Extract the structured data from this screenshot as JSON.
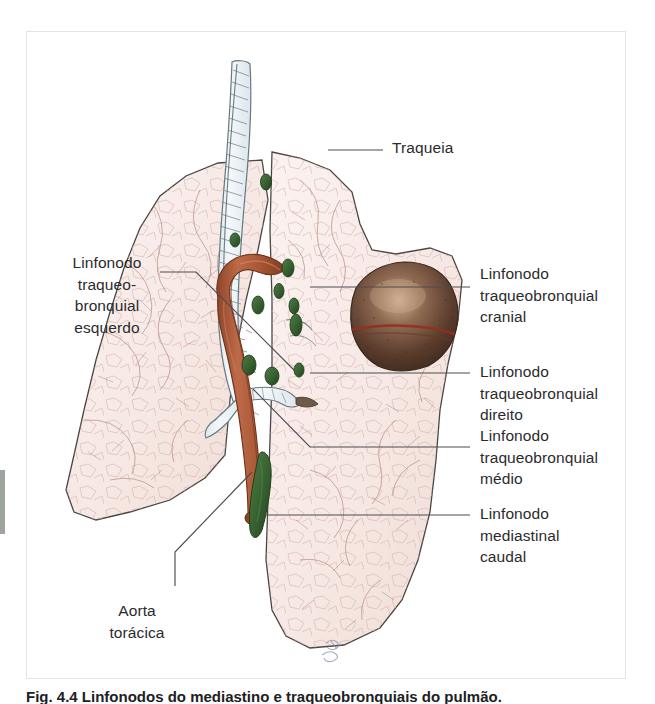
{
  "figure": {
    "title": "Linfonodos do mediastino e traqueobronquiais",
    "frame_border_color": "#e3e3e5",
    "background_color": "#ffffff",
    "label_color": "#2b2b2d",
    "leader_line_color": "#4d4d52"
  },
  "colors": {
    "lung_fill": "#f7ecea",
    "lung_mottle": "#e9cfc9",
    "lung_outline": "#4a4642",
    "trachea_fill": "#eef2f4",
    "trachea_outline": "#6b7b84",
    "aorta_fill": "#b5603f",
    "aorta_dark": "#8c4428",
    "lymph_node": "#3f6b3a",
    "lymph_node_dark": "#2b4a28",
    "heart_fill": "#5b4034",
    "heart_highlight": "#c8a288",
    "heart_groove": "#94301f"
  },
  "labels": {
    "trachea": {
      "text": "Traqueia",
      "x": 392,
      "y": 137,
      "align": "right"
    },
    "lymph_tracheobronchial_left": {
      "text": "Linfonodo\ntraqueo-\nbronquial\nesquerdo",
      "x": 47,
      "y": 252,
      "width": 120,
      "align": "left-centered"
    },
    "lymph_tracheobronchial_cranial": {
      "text": "Linfonodo\ntraqueobronquial\ncranial",
      "x": 480,
      "y": 263,
      "align": "right"
    },
    "lymph_tracheobronchial_right": {
      "text": "Linfonodo\ntraqueobronquial\ndireito",
      "x": 480,
      "y": 361,
      "align": "right"
    },
    "lymph_tracheobronchial_middle": {
      "text": "Linfonodo\ntraqueobronquial\nmédio",
      "x": 480,
      "y": 425,
      "align": "right"
    },
    "lymph_mediastinal_caudal": {
      "text": "Linfonodo\nmediastinal\ncaudal",
      "x": 480,
      "y": 503,
      "align": "right"
    },
    "aorta_thoracic": {
      "text": "Aorta\ntorácica",
      "x": 82,
      "y": 600,
      "align": "left-centered"
    }
  },
  "leader_lines": [
    {
      "name": "trachea-leader",
      "points": "328,150 383,150"
    },
    {
      "name": "lymph-left-leader",
      "points": "160,272 196,272 296,372"
    },
    {
      "name": "lymph-cranial-leader",
      "points": "310,287 470,287"
    },
    {
      "name": "lymph-right-leader",
      "points": "310,373 470,373"
    },
    {
      "name": "lymph-middle-leader",
      "points": "253,389 310,447 470,447"
    },
    {
      "name": "lymph-mediastinal-leader",
      "points": "262,515 470,515"
    },
    {
      "name": "aorta-leader",
      "points": "252,472 175,552 175,586"
    }
  ],
  "caption": {
    "text": "Fig. 4.4 Linfonodos do mediastino e traqueobronquiais do pulmão."
  },
  "signature": {
    "text": "artist-initials"
  }
}
